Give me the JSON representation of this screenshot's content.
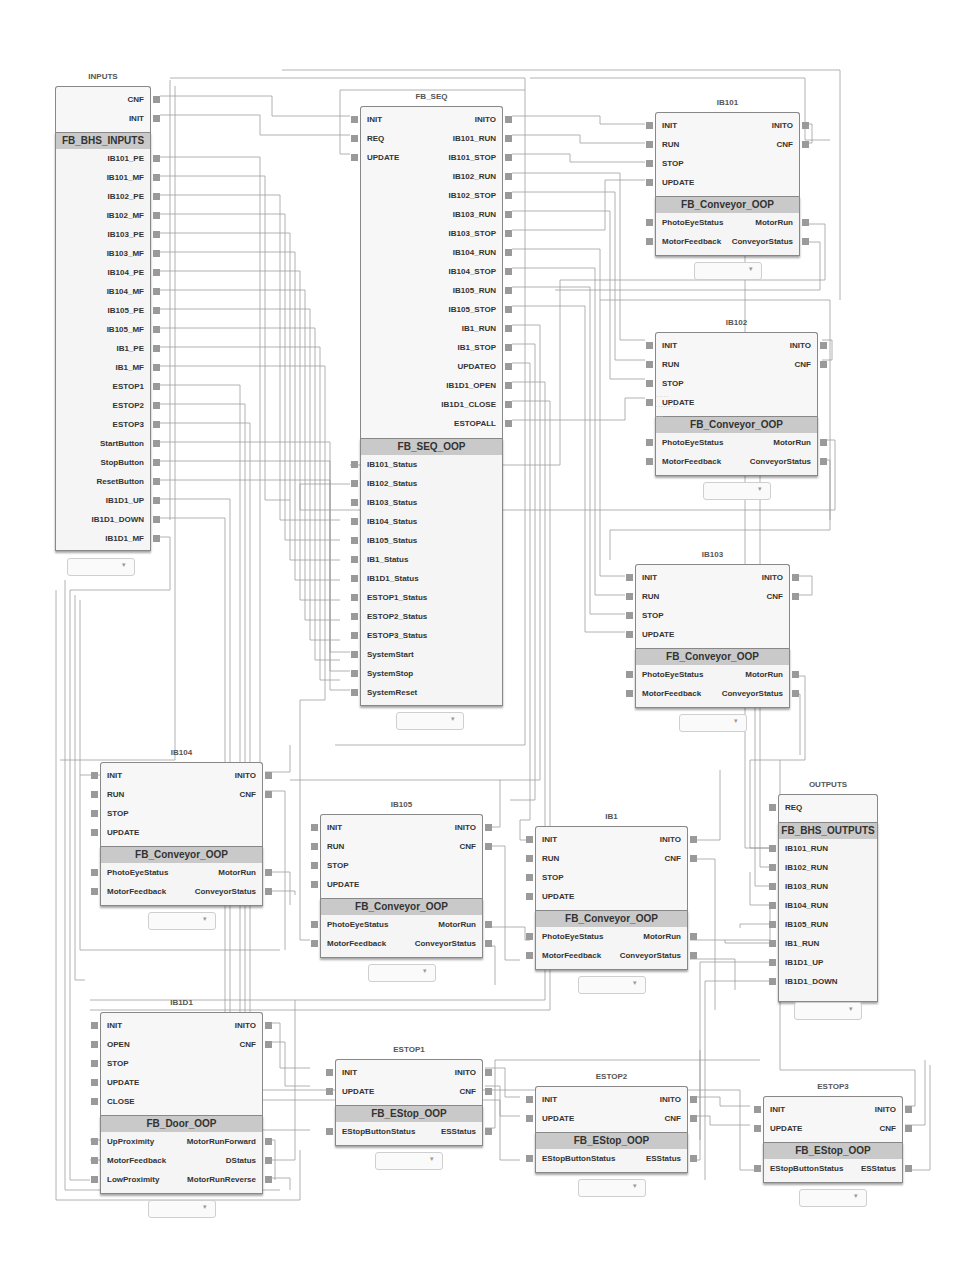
{
  "diagram": {
    "blocks": [
      {
        "id": "inputs",
        "instance": "INPUTS",
        "type": "FB_BHS_INPUTS",
        "event_inputs": [],
        "event_outputs": [
          "CNF",
          "INIT"
        ],
        "data_inputs": [],
        "data_outputs": [
          "IB101_PE",
          "IB101_MF",
          "IB102_PE",
          "IB102_MF",
          "IB103_PE",
          "IB103_MF",
          "IB104_PE",
          "IB104_MF",
          "IB105_PE",
          "IB105_MF",
          "IB1_PE",
          "IB1_MF",
          "ESTOP1",
          "ESTOP2",
          "ESTOP3",
          "StartButton",
          "StopButton",
          "ResetButton",
          "IB1D1_UP",
          "IB1D1_DOWN",
          "IB1D1_MF"
        ]
      },
      {
        "id": "fb_seq",
        "instance": "FB_SEQ",
        "type": "FB_SEQ_OOP",
        "event_inputs": [
          "INIT",
          "REQ",
          "UPDATE"
        ],
        "event_outputs": [
          "INITO",
          "IB101_RUN",
          "IB101_STOP",
          "IB102_RUN",
          "IB102_STOP",
          "IB103_RUN",
          "IB103_STOP",
          "IB104_RUN",
          "IB104_STOP",
          "IB105_RUN",
          "IB105_STOP",
          "IB1_RUN",
          "IB1_STOP",
          "UPDATEO",
          "IB1D1_OPEN",
          "IB1D1_CLOSE",
          "ESTOPALL"
        ],
        "data_inputs": [
          "IB101_Status",
          "IB102_Status",
          "IB103_Status",
          "IB104_Status",
          "IB105_Status",
          "IB1_Status",
          "IB1D1_Status",
          "ESTOP1_Status",
          "ESTOP2_Status",
          "ESTOP3_Status",
          "SystemStart",
          "SystemStop",
          "SystemReset"
        ],
        "data_outputs": []
      },
      {
        "id": "ib101",
        "instance": "IB101",
        "type": "FB_Conveyor_OOP",
        "event_inputs": [
          "INIT",
          "RUN",
          "STOP",
          "UPDATE"
        ],
        "event_outputs": [
          "INITO",
          "CNF"
        ],
        "data_inputs": [
          "PhotoEyeStatus",
          "MotorFeedback"
        ],
        "data_outputs": [
          "MotorRun",
          "ConveyorStatus"
        ]
      },
      {
        "id": "ib102",
        "instance": "IB102",
        "type": "FB_Conveyor_OOP",
        "event_inputs": [
          "INIT",
          "RUN",
          "STOP",
          "UPDATE"
        ],
        "event_outputs": [
          "INITO",
          "CNF"
        ],
        "data_inputs": [
          "PhotoEyeStatus",
          "MotorFeedback"
        ],
        "data_outputs": [
          "MotorRun",
          "ConveyorStatus"
        ]
      },
      {
        "id": "ib103",
        "instance": "IB103",
        "type": "FB_Conveyor_OOP",
        "event_inputs": [
          "INIT",
          "RUN",
          "STOP",
          "UPDATE"
        ],
        "event_outputs": [
          "INITO",
          "CNF"
        ],
        "data_inputs": [
          "PhotoEyeStatus",
          "MotorFeedback"
        ],
        "data_outputs": [
          "MotorRun",
          "ConveyorStatus"
        ]
      },
      {
        "id": "ib104",
        "instance": "IB104",
        "type": "FB_Conveyor_OOP",
        "event_inputs": [
          "INIT",
          "RUN",
          "STOP",
          "UPDATE"
        ],
        "event_outputs": [
          "INITO",
          "CNF"
        ],
        "data_inputs": [
          "PhotoEyeStatus",
          "MotorFeedback"
        ],
        "data_outputs": [
          "MotorRun",
          "ConveyorStatus"
        ]
      },
      {
        "id": "ib105",
        "instance": "IB105",
        "type": "FB_Conveyor_OOP",
        "event_inputs": [
          "INIT",
          "RUN",
          "STOP",
          "UPDATE"
        ],
        "event_outputs": [
          "INITO",
          "CNF"
        ],
        "data_inputs": [
          "PhotoEyeStatus",
          "MotorFeedback"
        ],
        "data_outputs": [
          "MotorRun",
          "ConveyorStatus"
        ]
      },
      {
        "id": "ib1",
        "instance": "IB1",
        "type": "FB_Conveyor_OOP",
        "event_inputs": [
          "INIT",
          "RUN",
          "STOP",
          "UPDATE"
        ],
        "event_outputs": [
          "INITO",
          "CNF"
        ],
        "data_inputs": [
          "PhotoEyeStatus",
          "MotorFeedback"
        ],
        "data_outputs": [
          "MotorRun",
          "ConveyorStatus"
        ]
      },
      {
        "id": "outputs",
        "instance": "OUTPUTS",
        "type": "FB_BHS_OUTPUTS",
        "event_inputs": [
          "REQ"
        ],
        "event_outputs": [],
        "data_inputs": [
          "IB101_RUN",
          "IB102_RUN",
          "IB103_RUN",
          "IB104_RUN",
          "IB105_RUN",
          "IB1_RUN",
          "IB1D1_UP",
          "IB1D1_DOWN"
        ],
        "data_outputs": []
      },
      {
        "id": "ib1d1",
        "instance": "IB1D1",
        "type": "FB_Door_OOP",
        "event_inputs": [
          "INIT",
          "OPEN",
          "STOP",
          "UPDATE",
          "CLOSE"
        ],
        "event_outputs": [
          "INITO",
          "CNF"
        ],
        "data_inputs": [
          "UpProximity",
          "MotorFeedback",
          "LowProximity"
        ],
        "data_outputs": [
          "MotorRunForward",
          "DStatus",
          "MotorRunReverse"
        ]
      },
      {
        "id": "estop1",
        "instance": "ESTOP1",
        "type": "FB_EStop_OOP",
        "event_inputs": [
          "INIT",
          "UPDATE"
        ],
        "event_outputs": [
          "INITO",
          "CNF"
        ],
        "data_inputs": [
          "EStopButtonStatus"
        ],
        "data_outputs": [
          "ESStatus"
        ]
      },
      {
        "id": "estop2",
        "instance": "ESTOP2",
        "type": "FB_EStop_OOP",
        "event_inputs": [
          "INIT",
          "UPDATE"
        ],
        "event_outputs": [
          "INITO",
          "CNF"
        ],
        "data_inputs": [
          "EStopButtonStatus"
        ],
        "data_outputs": [
          "ESStatus"
        ]
      },
      {
        "id": "estop3",
        "instance": "ESTOP3",
        "type": "FB_EStop_OOP",
        "event_inputs": [
          "INIT",
          "UPDATE"
        ],
        "event_outputs": [
          "INITO",
          "CNF"
        ],
        "data_inputs": [
          "EStopButtonStatus"
        ],
        "data_outputs": [
          "ESStatus"
        ]
      }
    ],
    "colors": {
      "block_border": "#888888",
      "block_fill": "#f5f5f5",
      "type_bar": "#c9c9c9",
      "pin": "#9a9a9a",
      "wire": "#9c9c9c"
    }
  }
}
